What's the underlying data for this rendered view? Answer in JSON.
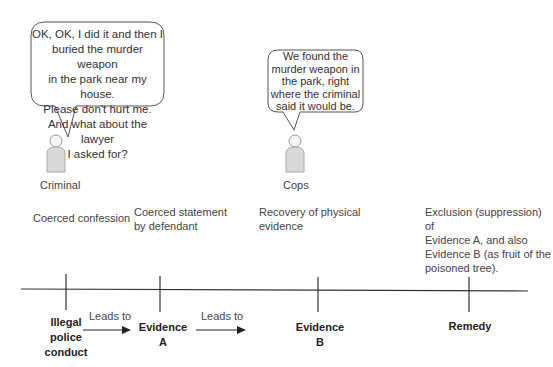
{
  "speakers": [
    {
      "name": "Criminal",
      "quote": [
        "OK, OK, I did it and then I",
        "buried the murder weapon",
        "in the park near my house.",
        "Please don't hurt me.",
        "And what about the lawyer",
        "I asked for?"
      ]
    },
    {
      "name": "Cops",
      "quote": [
        "We found the",
        "murder weapon in",
        "the park, right",
        "where the criminal",
        "said it would be."
      ]
    }
  ],
  "captions": [
    [
      "Coerced confession"
    ],
    [
      "Coerced statement",
      "by defendant"
    ],
    [
      "Recovery of physical",
      "evidence"
    ],
    [
      "Exclusion (suppression) of",
      "Evidence A, and also",
      "Evidence B (as fruit of the",
      "poisoned tree)."
    ]
  ],
  "timeline": {
    "nodes": [
      [
        "Illegal",
        "police",
        "conduct"
      ],
      [
        "Evidence",
        "A"
      ],
      [
        "Evidence",
        "B"
      ],
      [
        "Remedy"
      ]
    ],
    "arrows": [
      "Leads to",
      "Leads to"
    ]
  },
  "colors": {
    "line": "#333333",
    "bubble_border": "#555555",
    "figure_fill": "#d8d8d8"
  }
}
